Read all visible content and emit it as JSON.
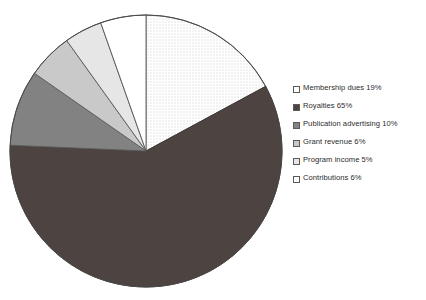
{
  "chart_data": {
    "type": "pie",
    "title": "",
    "subtitle": "",
    "xlabel": "",
    "ylabel": "",
    "grid": false,
    "legend_position": "right",
    "start_angle_deg": 0,
    "direction": "clockwise",
    "categories": [
      "Membership dues",
      "Royalties",
      "Publication advertising",
      "Grant revenue",
      "Program income",
      "Contributions"
    ],
    "values": [
      19,
      65,
      10,
      6,
      5,
      6
    ],
    "value_unit": "%",
    "slices": [
      {
        "label": "Membership dues",
        "value": 19,
        "legend_text": "Membership dues 19%",
        "fill": "#ffffff",
        "pattern": "fine-dots",
        "pattern_color": "#9a9a9a",
        "stroke": "#555555"
      },
      {
        "label": "Royalties",
        "value": 65,
        "legend_text": "Royalties 65%",
        "fill": "#4d4441",
        "pattern": "solid",
        "pattern_color": "#4d4441",
        "stroke": "#3a3330"
      },
      {
        "label": "Publication advertising",
        "value": 10,
        "legend_text": "Publication advertising 10%",
        "fill": "#828282",
        "pattern": "solid",
        "pattern_color": "#828282",
        "stroke": "#5a5a5a"
      },
      {
        "label": "Grant revenue",
        "value": 6,
        "legend_text": "Grant revenue 6%",
        "fill": "#c9c9c9",
        "pattern": "solid",
        "pattern_color": "#c9c9c9",
        "stroke": "#5a5a5a"
      },
      {
        "label": "Program income",
        "value": 5,
        "legend_text": "Program income 5%",
        "fill": "#e6e6e6",
        "pattern": "solid",
        "pattern_color": "#e6e6e6",
        "stroke": "#5a5a5a"
      },
      {
        "label": "Contributions",
        "value": 6,
        "legend_text": "Contributions 6%",
        "fill": "#ffffff",
        "pattern": "solid",
        "pattern_color": "#ffffff",
        "stroke": "#555555"
      }
    ],
    "geometry": {
      "center_x": 146,
      "center_y": 151,
      "radius": 136
    }
  },
  "legend": {
    "items": [
      {
        "text": "Membership dues 19%",
        "swatch": "legend-swatch-dotted"
      },
      {
        "text": "Royalties 65%",
        "swatch": "legend-swatch-dark"
      },
      {
        "text": "Publication advertising 10%",
        "swatch": "legend-swatch-gray"
      },
      {
        "text": "Grant revenue 6%",
        "swatch": "legend-swatch-lightgray"
      },
      {
        "text": "Program income 5%",
        "swatch": "legend-swatch-verylight"
      },
      {
        "text": "Contributions 6%",
        "swatch": "legend-swatch-white"
      }
    ]
  }
}
